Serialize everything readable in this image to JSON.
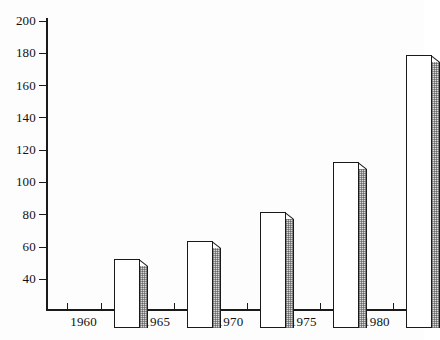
{
  "chart_data": {
    "type": "bar",
    "title": "",
    "subtitle": "",
    "xlabel": "",
    "ylabel": "",
    "categories": [
      "1960",
      "1965",
      "1970",
      "1975",
      "1980"
    ],
    "values": [
      64,
      75,
      93,
      124,
      190
    ],
    "series": [
      {
        "name": "",
        "values": [
          64,
          75,
          93,
          124,
          190
        ]
      }
    ],
    "ylim": [
      21,
      200
    ],
    "yticks": [
      40,
      60,
      80,
      100,
      120,
      140,
      160,
      180,
      200
    ],
    "ytick_labels": [
      "40",
      "60",
      "80",
      "100",
      "120",
      "140",
      "160",
      "180",
      "200"
    ],
    "xtick_labels": [
      "1960",
      "1965",
      "1970",
      "1975",
      "1980"
    ],
    "grid": false,
    "legend": false,
    "legend_position": "none",
    "style": {
      "bar_face_color": "#ffffff",
      "bar_edge_color": "#1a1a1a",
      "bar_side_color": "#d9d9d9",
      "axis_color": "#1a1a1a",
      "background_color": "#ffffff",
      "text_color": "#111111"
    },
    "annotations": []
  },
  "axes": {
    "y": {
      "ticks": [
        {
          "label": "200",
          "value": 200
        },
        {
          "label": "180",
          "value": 180
        },
        {
          "label": "160",
          "value": 160
        },
        {
          "label": "140",
          "value": 140
        },
        {
          "label": "120",
          "value": 120
        },
        {
          "label": "100",
          "value": 100
        },
        {
          "label": "80",
          "value": 80
        },
        {
          "label": "60",
          "value": 60
        },
        {
          "label": "40",
          "value": 40
        }
      ]
    },
    "x": {
      "ticks": [
        {
          "label": "1960",
          "value": 64
        },
        {
          "label": "1965",
          "value": 75
        },
        {
          "label": "1970",
          "value": 93
        },
        {
          "label": "1975",
          "value": 124
        },
        {
          "label": "1980",
          "value": 190
        }
      ]
    }
  }
}
